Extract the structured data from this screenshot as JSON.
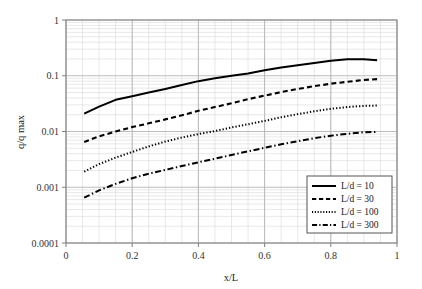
{
  "chart_data": {
    "type": "line",
    "title": "",
    "subtitle": "",
    "xlabel": "x/L",
    "ylabel": "q/q max",
    "xscale": "linear",
    "yscale": "log",
    "xlim": [
      0,
      1
    ],
    "ylim": [
      0.0001,
      1
    ],
    "grid": true,
    "grid_minor": true,
    "legend_position": "lower-right",
    "xticks": [
      "0",
      "0.2",
      "0.4",
      "0.6",
      "0.8",
      "1"
    ],
    "xtick_values": [
      0,
      0.2,
      0.4,
      0.6,
      0.8,
      1
    ],
    "yticks": [
      "1",
      "0.1",
      "0.01",
      "0.001",
      "0.0001"
    ],
    "ytick_values": [
      1,
      0.1,
      0.01,
      0.001,
      0.0001
    ],
    "series": [
      {
        "name": "L/d = 10",
        "style": "solid",
        "x": [
          0.055,
          0.1,
          0.15,
          0.2,
          0.25,
          0.3,
          0.35,
          0.4,
          0.45,
          0.5,
          0.55,
          0.6,
          0.65,
          0.7,
          0.75,
          0.8,
          0.85,
          0.9,
          0.94
        ],
        "values": [
          0.021,
          0.028,
          0.037,
          0.043,
          0.05,
          0.058,
          0.068,
          0.08,
          0.09,
          0.1,
          0.11,
          0.125,
          0.14,
          0.155,
          0.17,
          0.185,
          0.198,
          0.198,
          0.19
        ]
      },
      {
        "name": "L/d = 30",
        "style": "dashed",
        "x": [
          0.055,
          0.1,
          0.15,
          0.2,
          0.25,
          0.3,
          0.35,
          0.4,
          0.45,
          0.5,
          0.55,
          0.6,
          0.65,
          0.7,
          0.75,
          0.8,
          0.85,
          0.9,
          0.94
        ],
        "values": [
          0.0065,
          0.0082,
          0.01,
          0.012,
          0.014,
          0.0165,
          0.0195,
          0.0235,
          0.0275,
          0.032,
          0.038,
          0.044,
          0.051,
          0.058,
          0.065,
          0.072,
          0.078,
          0.084,
          0.087
        ]
      },
      {
        "name": "L/d = 100",
        "style": "dotted",
        "x": [
          0.055,
          0.1,
          0.15,
          0.2,
          0.25,
          0.3,
          0.35,
          0.4,
          0.45,
          0.5,
          0.55,
          0.6,
          0.65,
          0.7,
          0.75,
          0.8,
          0.85,
          0.9,
          0.94
        ],
        "values": [
          0.0019,
          0.0026,
          0.0034,
          0.0043,
          0.0054,
          0.0066,
          0.0078,
          0.009,
          0.0102,
          0.0118,
          0.0135,
          0.0155,
          0.018,
          0.0205,
          0.023,
          0.0255,
          0.0275,
          0.0288,
          0.0292
        ]
      },
      {
        "name": "L/d = 300",
        "style": "dashdot",
        "x": [
          0.055,
          0.1,
          0.15,
          0.2,
          0.25,
          0.3,
          0.35,
          0.4,
          0.45,
          0.5,
          0.55,
          0.6,
          0.65,
          0.7,
          0.75,
          0.8,
          0.85,
          0.9,
          0.94
        ],
        "values": [
          0.00065,
          0.00088,
          0.00115,
          0.00145,
          0.00175,
          0.00205,
          0.0024,
          0.0028,
          0.00325,
          0.0038,
          0.0044,
          0.0051,
          0.0059,
          0.0067,
          0.0076,
          0.0084,
          0.0091,
          0.0097,
          0.00985
        ]
      }
    ]
  },
  "legend": {
    "entries": [
      {
        "label": "L/d = 10",
        "style": "solid"
      },
      {
        "label": "L/d = 30",
        "style": "dashed"
      },
      {
        "label": "L/d = 100",
        "style": "dotted"
      },
      {
        "label": "L/d = 300",
        "style": "dashdot"
      }
    ]
  },
  "colors": {
    "line": "#000000",
    "grid_major": "#b4b4b4",
    "grid_minor": "#d9d9d9",
    "axis": "#808080",
    "text": "#1a1a1a",
    "background": "#ffffff"
  }
}
